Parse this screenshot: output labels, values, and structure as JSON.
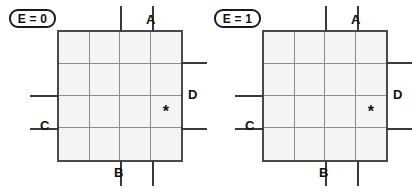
{
  "figure": {
    "background_color": "#ffffff",
    "cell_fill_color": "#f4f4f4",
    "grid_line_color": "#8e8e8e",
    "border_color": "#4a4a4a",
    "marker_color": "#3a3a3a",
    "text_color": "#111111"
  },
  "panels": [
    {
      "id": "kmap-e0",
      "badge": "E = 0",
      "grid": {
        "rows": 4,
        "columns": 4,
        "marked_cells": [
          {
            "row": 3,
            "column": 4,
            "symbol": "*"
          }
        ]
      },
      "variables": [
        {
          "name": "A",
          "position": "top",
          "label": "A"
        },
        {
          "name": "B",
          "position": "bottom",
          "label": "B"
        },
        {
          "name": "C",
          "position": "left",
          "label": "C"
        },
        {
          "name": "D",
          "position": "right",
          "label": "D"
        }
      ]
    },
    {
      "id": "kmap-e1",
      "badge": "E = 1",
      "grid": {
        "rows": 4,
        "columns": 4,
        "marked_cells": [
          {
            "row": 3,
            "column": 4,
            "symbol": "*"
          }
        ]
      },
      "variables": [
        {
          "name": "A",
          "position": "top",
          "label": "A"
        },
        {
          "name": "B",
          "position": "bottom",
          "label": "B"
        },
        {
          "name": "C",
          "position": "left",
          "label": "C"
        },
        {
          "name": "D",
          "position": "right",
          "label": "D"
        }
      ]
    }
  ]
}
